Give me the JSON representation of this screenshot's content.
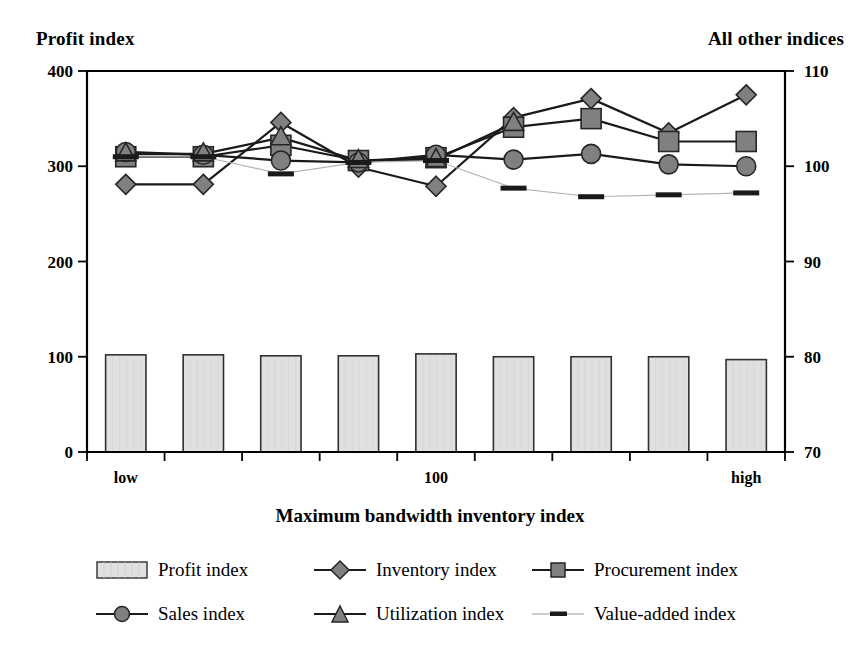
{
  "titles": {
    "left_axis_title": "Profit index",
    "right_axis_title": "All other indices",
    "x_axis_title": "Maximum bandwidth inventory index"
  },
  "axes": {
    "left_ticks": [
      "0",
      "100",
      "200",
      "300",
      "400"
    ],
    "right_ticks": [
      "70",
      "80",
      "90",
      "100",
      "110"
    ],
    "category_labels": [
      "low",
      "100",
      "high"
    ]
  },
  "legend": {
    "items": [
      {
        "label": "Profit index",
        "symbol": "bar-swatch"
      },
      {
        "label": "Inventory index",
        "symbol": "diamond-marker"
      },
      {
        "label": "Procurement index",
        "symbol": "square-marker"
      },
      {
        "label": "Sales index",
        "symbol": "circle-marker"
      },
      {
        "label": "Utilization index",
        "symbol": "triangle-marker"
      },
      {
        "label": "Value-added index",
        "symbol": "dash-marker"
      }
    ]
  },
  "colors": {
    "marker_fill": "#808080",
    "bar_fill": "#e0e0e0",
    "line": "#1a1a1a",
    "thin_line": "#b5b5b5",
    "axis": "#000000"
  },
  "chart_data": {
    "type": "line",
    "title": "",
    "subtitle": "",
    "xlabel": "Maximum bandwidth inventory index",
    "ylabel": "Profit index",
    "y2label": "All other indices",
    "grid": false,
    "legend_position": "bottom",
    "x": [
      1,
      2,
      3,
      4,
      5,
      6,
      7,
      8,
      9
    ],
    "xticklabels": [
      "low",
      "",
      "",
      "",
      "100",
      "",
      "",
      "",
      "high"
    ],
    "ylim": [
      0,
      400
    ],
    "y2lim": [
      70,
      110
    ],
    "yticks": [
      0,
      100,
      200,
      300,
      400
    ],
    "y2ticks": [
      70,
      80,
      90,
      100,
      110
    ],
    "series": [
      {
        "name": "Profit index",
        "axis": "left",
        "kind": "bar",
        "values": [
          102,
          102,
          101,
          101,
          103,
          100,
          100,
          100,
          97
        ]
      },
      {
        "name": "Inventory index",
        "axis": "right",
        "kind": "line",
        "marker": "diamond",
        "values": [
          98.1,
          98.1,
          104.6,
          99.9,
          97.9,
          105.1,
          107.1,
          103.5,
          107.5
        ]
      },
      {
        "name": "Procurement index",
        "axis": "right",
        "kind": "line",
        "marker": "square",
        "values": [
          101.0,
          101.0,
          102.2,
          100.6,
          100.9,
          104.1,
          105.0,
          102.6,
          102.6
        ]
      },
      {
        "name": "Sales index",
        "axis": "right",
        "kind": "line",
        "marker": "circle",
        "values": [
          101.5,
          101.2,
          100.6,
          100.4,
          101.2,
          100.7,
          101.3,
          100.2,
          100.0
        ]
      },
      {
        "name": "Utilization index",
        "axis": "right",
        "kind": "line",
        "marker": "triangle",
        "values": [
          101.3,
          101.3,
          103.0,
          100.6,
          100.7,
          104.5,
          null,
          null,
          null
        ]
      },
      {
        "name": "Value-added index",
        "axis": "right",
        "kind": "line",
        "marker": "dash",
        "values": [
          101.0,
          101.0,
          99.2,
          100.4,
          100.6,
          97.7,
          96.8,
          97.0,
          97.2
        ]
      }
    ]
  }
}
